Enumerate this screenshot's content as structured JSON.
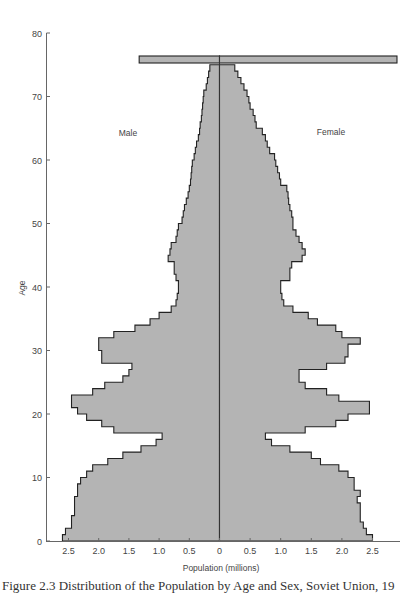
{
  "chart_data": {
    "type": "bar",
    "subtype": "population-pyramid",
    "title": "",
    "xlabel": "Population (millions)",
    "ylabel": "Age",
    "xlim": [
      -2.85,
      2.95
    ],
    "ylim": [
      0,
      80
    ],
    "x_ticks": [
      "2.5",
      "2.0",
      "1.5",
      "1.0",
      "0.5",
      "0",
      "0.5",
      "1.0",
      "1.5",
      "2.0",
      "2.5"
    ],
    "y_ticks": [
      "0",
      "10",
      "20",
      "30",
      "40",
      "50",
      "60",
      "70",
      "80"
    ],
    "grid": false,
    "annotations": [
      "Male",
      "Female"
    ],
    "age_bins": "single years 0-74, plus open-ended 75+ bar",
    "series": [
      {
        "name": "Male",
        "side": "left",
        "ages": [
          0,
          1,
          2,
          3,
          4,
          5,
          6,
          7,
          8,
          9,
          10,
          11,
          12,
          13,
          14,
          15,
          16,
          17,
          18,
          19,
          20,
          21,
          22,
          23,
          24,
          25,
          26,
          27,
          28,
          29,
          30,
          31,
          32,
          33,
          34,
          35,
          36,
          37,
          38,
          39,
          40,
          41,
          42,
          43,
          44,
          45,
          46,
          47,
          48,
          49,
          50,
          51,
          52,
          53,
          54,
          55,
          56,
          57,
          58,
          59,
          60,
          61,
          62,
          63,
          64,
          65,
          66,
          67,
          68,
          69,
          70,
          71,
          72,
          73,
          74,
          "75+"
        ],
        "values": [
          2.6,
          2.55,
          2.45,
          2.45,
          2.4,
          2.4,
          2.4,
          2.35,
          2.35,
          2.3,
          2.2,
          2.1,
          1.85,
          1.6,
          1.3,
          1.05,
          0.95,
          1.75,
          1.95,
          2.2,
          2.35,
          2.45,
          2.45,
          2.1,
          1.9,
          1.6,
          1.5,
          1.45,
          1.95,
          1.95,
          2.0,
          2.0,
          1.75,
          1.4,
          1.15,
          1.0,
          0.8,
          0.72,
          0.7,
          0.68,
          0.68,
          0.72,
          0.75,
          0.75,
          0.85,
          0.82,
          0.8,
          0.72,
          0.7,
          0.68,
          0.62,
          0.6,
          0.58,
          0.55,
          0.52,
          0.5,
          0.48,
          0.47,
          0.46,
          0.45,
          0.42,
          0.4,
          0.38,
          0.35,
          0.33,
          0.32,
          0.3,
          0.29,
          0.28,
          0.27,
          0.26,
          0.22,
          0.2,
          0.18,
          0.16,
          1.33
        ]
      },
      {
        "name": "Female",
        "side": "right",
        "ages": [
          0,
          1,
          2,
          3,
          4,
          5,
          6,
          7,
          8,
          9,
          10,
          11,
          12,
          13,
          14,
          15,
          16,
          17,
          18,
          19,
          20,
          21,
          22,
          23,
          24,
          25,
          26,
          27,
          28,
          29,
          30,
          31,
          32,
          33,
          34,
          35,
          36,
          37,
          38,
          39,
          40,
          41,
          42,
          43,
          44,
          45,
          46,
          47,
          48,
          49,
          50,
          51,
          52,
          53,
          54,
          55,
          56,
          57,
          58,
          59,
          60,
          61,
          62,
          63,
          64,
          65,
          66,
          67,
          68,
          69,
          70,
          71,
          72,
          73,
          74,
          "75+"
        ],
        "values": [
          2.5,
          2.4,
          2.35,
          2.3,
          2.3,
          2.3,
          2.25,
          2.3,
          2.2,
          2.2,
          2.1,
          1.95,
          1.65,
          1.5,
          1.15,
          0.85,
          0.75,
          1.4,
          1.9,
          2.1,
          2.45,
          2.45,
          1.95,
          1.75,
          1.4,
          1.3,
          1.3,
          1.75,
          2.05,
          2.1,
          2.1,
          2.3,
          2.0,
          1.9,
          1.6,
          1.45,
          1.2,
          1.05,
          1.02,
          1.0,
          1.0,
          1.15,
          1.15,
          1.18,
          1.35,
          1.4,
          1.35,
          1.3,
          1.25,
          1.2,
          1.2,
          1.18,
          1.15,
          1.13,
          1.12,
          1.1,
          1.0,
          0.98,
          0.95,
          0.92,
          0.9,
          0.82,
          0.78,
          0.75,
          0.7,
          0.6,
          0.58,
          0.55,
          0.5,
          0.48,
          0.45,
          0.4,
          0.35,
          0.3,
          0.25,
          2.9
        ]
      }
    ]
  },
  "labels": {
    "male": "Male",
    "female": "Female",
    "xlabel": "Population (millions)",
    "ylabel": "Age"
  },
  "caption": "Figure 2.3   Distribution of the Population by Age and Sex, Soviet Union, 19"
}
